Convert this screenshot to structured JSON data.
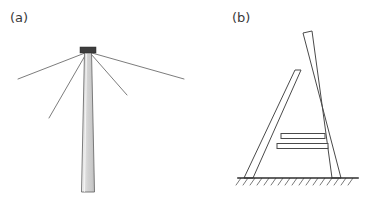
{
  "figure": {
    "type": "technical-line-diagram",
    "background_color": "#ffffff",
    "width": 370,
    "height": 198,
    "panels": [
      {
        "id": "a",
        "label": "(a)",
        "label_x": 10,
        "label_y": 22,
        "subject": "guyed-mast",
        "description": "Tapered vertical mast with dark cap at apex and four guy wires radiating down-left and down-right",
        "mast": {
          "apex_x": 88,
          "apex_y": 52,
          "base_y": 192,
          "apex_half_width": 3.5,
          "base_half_width": 6.5,
          "fill_light": "#f0f0f0",
          "fill_mid": "#d8d8d8",
          "fill_dark": "#c2c2c2",
          "edge_color": "#6e6e6e",
          "edge_width": 0.9
        },
        "cap": {
          "x": 80,
          "y": 47,
          "width": 16,
          "height": 6,
          "fill": "#3d3d3d"
        },
        "guy_wires": [
          {
            "name": "guy-wire-outer-left",
            "x1": 85,
            "y1": 53,
            "x2": 18,
            "y2": 79,
            "color": "#5a5a5a",
            "width": 0.8
          },
          {
            "name": "guy-wire-inner-left",
            "x1": 86,
            "y1": 54,
            "x2": 49,
            "y2": 118,
            "color": "#5a5a5a",
            "width": 0.8
          },
          {
            "name": "guy-wire-inner-right",
            "x1": 91,
            "y1": 54,
            "x2": 127,
            "y2": 95,
            "color": "#5a5a5a",
            "width": 0.8
          },
          {
            "name": "guy-wire-outer-right",
            "x1": 92,
            "y1": 53,
            "x2": 184,
            "y2": 79,
            "color": "#5a5a5a",
            "width": 0.8
          }
        ]
      },
      {
        "id": "b",
        "label": "(b)",
        "label_x": 232,
        "label_y": 22,
        "subject": "a-frame-sheer-legs",
        "description": "A-frame of two crossed legs with two horizontal rungs standing on a hatched ground line",
        "left_leg": {
          "name": "left-leg",
          "top_outer_x": 295,
          "top_outer_y": 70,
          "top_inner_x": 301,
          "top_inner_y": 70,
          "bottom_outer_x": 244,
          "bottom_outer_y": 178,
          "bottom_inner_x": 253,
          "bottom_inner_y": 178,
          "fill": "#ffffff",
          "edge_color": "#4a4a4a",
          "edge_width": 1.0
        },
        "right_leg": {
          "name": "right-leg",
          "top_outer_x": 303,
          "top_outer_y": 33,
          "top_inner_x": 312,
          "top_inner_y": 31,
          "bottom_outer_x": 341,
          "bottom_outer_y": 178,
          "bottom_inner_x": 332,
          "bottom_inner_y": 178,
          "fill": "#ffffff",
          "edge_color": "#4a4a4a",
          "edge_width": 1.0
        },
        "rungs": [
          {
            "name": "rung-upper",
            "x1": 281,
            "y1": 136,
            "x2": 325,
            "y2": 136,
            "thickness": 5,
            "fill": "#ffffff",
            "edge_color": "#4a4a4a"
          },
          {
            "name": "rung-lower",
            "x1": 277,
            "y1": 146,
            "x2": 328,
            "y2": 146,
            "thickness": 5,
            "fill": "#ffffff",
            "edge_color": "#4a4a4a"
          }
        ],
        "ground": {
          "name": "ground-line",
          "x1": 238,
          "x2": 358,
          "y": 178,
          "line_color": "#2e2e2e",
          "line_width": 1.6,
          "hatch_color": "#6a6a6a",
          "hatch_width": 0.9,
          "hatch_length": 9,
          "hatch_spacing": 7,
          "hatch_angle_deg": 55
        }
      }
    ]
  }
}
